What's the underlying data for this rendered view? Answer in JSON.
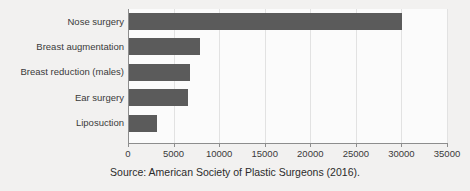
{
  "chart_data": {
    "type": "bar",
    "orientation": "horizontal",
    "title": "",
    "subtitle": "",
    "xlabel": "",
    "ylabel": "",
    "categories": [
      "Nose surgery",
      "Breast augmentation",
      "Breast reduction (males)",
      "Breast reduction (males)"
    ],
    "bars": [
      {
        "label": "Nose surgery",
        "value": 30100
      },
      {
        "label": "Breast augmentation",
        "value": 7900
      },
      {
        "label": "Breast reduction (males)",
        "value": 6800
      },
      {
        "label": "Ear surgery",
        "value": 6550
      },
      {
        "label": "Liposuction",
        "value": 3200
      }
    ],
    "xticks": [
      0,
      5000,
      10000,
      15000,
      20000,
      25000,
      30000,
      35000
    ],
    "xtick_labels": [
      "0",
      "5000",
      "10000",
      "15000",
      "20000",
      "25000",
      "30000",
      "35000"
    ],
    "xlim": [
      0,
      35000
    ],
    "grid": true,
    "grid_axis": "x",
    "legend": null,
    "bar_color": "#5b5b5b",
    "plot_background": "#fbfbfb",
    "page_background": "#f2f1f0",
    "gridline_color": "#e2e2e2",
    "axis_color": "#8d8d8d",
    "annotation": "Source: American Society of Plastic Surgeons (2016)."
  },
  "caption": {
    "source_text": "Source: American Society of Plastic Surgeons (2016)."
  }
}
